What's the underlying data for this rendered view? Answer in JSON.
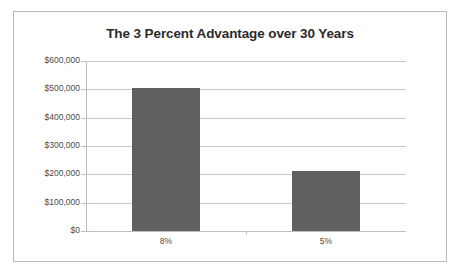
{
  "chart_data": {
    "type": "bar",
    "title": "The 3 Percent Advantage over 30 Years",
    "categories": [
      "8%",
      "5%"
    ],
    "values": [
      505000,
      212000
    ],
    "xlabel": "",
    "ylabel": "",
    "ylim": [
      0,
      600000
    ],
    "ytick_values": [
      0,
      100000,
      200000,
      300000,
      400000,
      500000,
      600000
    ],
    "ytick_labels": [
      "$0",
      "$100,000",
      "$200,000",
      "$300,000",
      "$400,000",
      "$500,000",
      "$600,000"
    ],
    "grid": true,
    "legend": false,
    "bar_color": "#606060",
    "gridline_color": "#c8c8c8",
    "border_color": "#b9b9b9",
    "title_color": "#2b2b2b",
    "tick_label_color": "#4a4a4a",
    "background": "#ffffff"
  }
}
